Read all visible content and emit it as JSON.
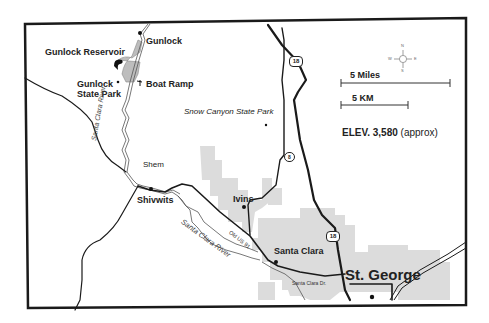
{
  "map": {
    "title_elevation": "ELEV. 3,580",
    "elevation_note": "(approx)",
    "scale": {
      "miles_label": "5 Miles",
      "km_label": "5 KM"
    },
    "compass": {
      "n": "N",
      "s": "S",
      "e": "E",
      "w": "W"
    },
    "places": {
      "gunlock": "Gunlock",
      "gunlock_reservoir": "Gunlock Reservoir",
      "gunlock_state_park_1": "Gunlock",
      "gunlock_state_park_2": "State Park",
      "boat_ramp": "Boat Ramp",
      "snow_canyon": "Snow Canyon State Park",
      "shem": "Shem",
      "shivwits": "Shivwits",
      "ivins": "Ivins",
      "santa_clara": "Santa Clara",
      "st_george": "St. George"
    },
    "water": {
      "santa_clara_river_north": "Santa Clara River",
      "santa_clara_river_south": "Santa Clara River"
    },
    "roads": {
      "old_us_91": "Old US 91",
      "santa_clara_dr": "Santa Clara Dr.",
      "route_18_a": "18",
      "route_18_b": "18",
      "route_8": "8"
    },
    "colors": {
      "frame": "#1a1a1a",
      "road": "#1a1a1a",
      "urban_area": "#d9d9d9",
      "reservoir": "#bdbdbd",
      "river": "#555555"
    }
  }
}
